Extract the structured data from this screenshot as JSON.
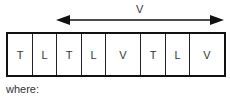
{
  "diagram": {
    "arrow": {
      "label": "V",
      "direction": "bidirectional"
    },
    "cells": [
      {
        "label": "T",
        "width": 25
      },
      {
        "label": "L",
        "width": 24
      },
      {
        "label": "T",
        "width": 25
      },
      {
        "label": "L",
        "width": 24
      },
      {
        "label": "V",
        "width": 35
      },
      {
        "label": "T",
        "width": 25
      },
      {
        "label": "L",
        "width": 24
      },
      {
        "label": "V",
        "width": 34
      }
    ],
    "caption": "where:"
  }
}
